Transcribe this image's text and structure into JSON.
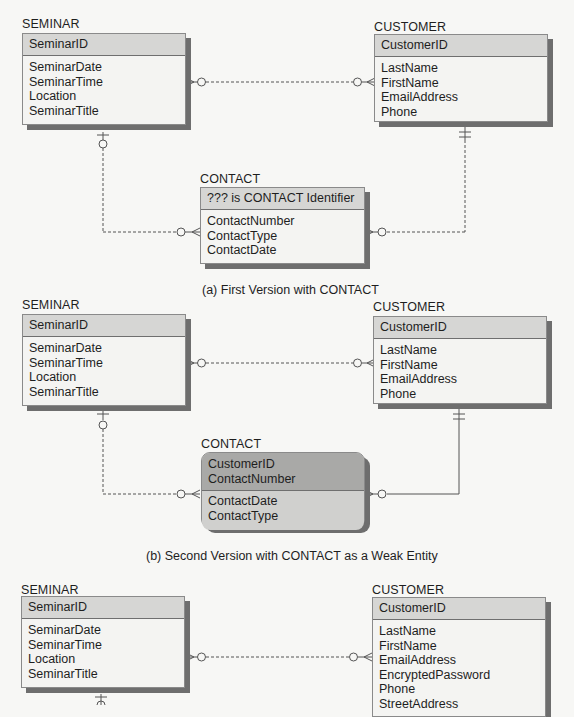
{
  "diagrams": [
    {
      "caption": "(a) First Version with CONTACT",
      "seminar": {
        "name": "SEMINAR",
        "key": "SeminarID",
        "attributes": [
          "SeminarDate",
          "SeminarTime",
          "Location",
          "SeminarTitle"
        ]
      },
      "customer": {
        "name": "CUSTOMER",
        "key": "CustomerID",
        "attributes": [
          "LastName",
          "FirstName",
          "EmailAddress",
          "Phone"
        ]
      },
      "contact": {
        "name": "CONTACT",
        "key": "??? is CONTACT Identifier",
        "attributes": [
          "ContactNumber",
          "ContactType",
          "ContactDate"
        ],
        "weak": false
      }
    },
    {
      "caption": "(b) Second Version with CONTACT as a Weak Entity",
      "seminar": {
        "name": "SEMINAR",
        "key": "SeminarID",
        "attributes": [
          "SeminarDate",
          "SeminarTime",
          "Location",
          "SeminarTitle"
        ]
      },
      "customer": {
        "name": "CUSTOMER",
        "key": "CustomerID",
        "attributes": [
          "LastName",
          "FirstName",
          "EmailAddress",
          "Phone"
        ]
      },
      "contact": {
        "name": "CONTACT",
        "key_lines": [
          "CustomerID",
          "ContactNumber"
        ],
        "attributes": [
          "ContactDate",
          "ContactType"
        ],
        "weak": true
      }
    },
    {
      "seminar": {
        "name": "SEMINAR",
        "key": "SeminarID",
        "attributes": [
          "SeminarDate",
          "SeminarTime",
          "Location",
          "SeminarTitle"
        ]
      },
      "customer": {
        "name": "CUSTOMER",
        "key": "CustomerID",
        "attributes": [
          "LastName",
          "FirstName",
          "EmailAddress",
          "EncryptedPassword",
          "Phone",
          "StreetAddress"
        ]
      }
    }
  ],
  "colors": {
    "entity_fill": "#f4f4f2",
    "key_fill": "#d6d6d4",
    "weak_key_fill": "#a9a9a7",
    "weak_attr_fill": "#d0d0ce",
    "shadow": "#6e6e6e",
    "line": "#555555"
  }
}
